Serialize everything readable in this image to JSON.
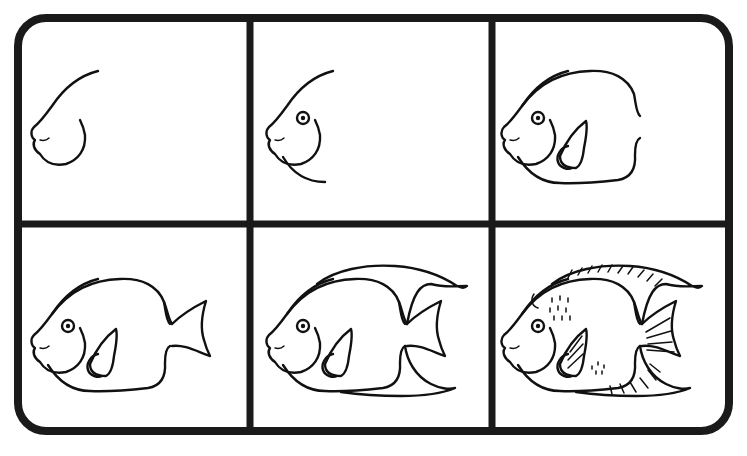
{
  "title": "How to draw an angelfish - step by step",
  "colors": {
    "line": "#111111",
    "frame": "#1a1a1a",
    "background": "#ffffff"
  },
  "grid": {
    "rows": 2,
    "columns": 3
  },
  "panels": [
    {
      "step": "1",
      "description": "Head curve with mouth and gill arc"
    },
    {
      "step": "2",
      "description": "Add eye and lower body curve"
    },
    {
      "step": "3",
      "description": "Complete body outline and pectoral fin"
    },
    {
      "step": "4",
      "description": "Add tail fin"
    },
    {
      "step": "5",
      "description": "Add dorsal and anal fins"
    },
    {
      "step": "6",
      "description": "Add fin stripes, scale dots and details"
    }
  ]
}
